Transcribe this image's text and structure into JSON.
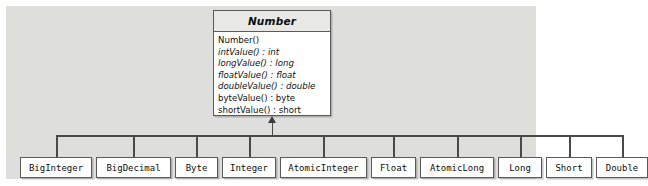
{
  "diagram": {
    "type": "uml-class-diagram",
    "relationship": "generalization",
    "canvas_color": "#dededc",
    "box_fill": "#ffffff",
    "header_fill": "#e8e8e6",
    "line_color": "#4a4a4a",
    "superclass": {
      "name": "Number",
      "abstract": true,
      "members": [
        {
          "text": "Number()",
          "abstract": false
        },
        {
          "text": "intValue() : int",
          "abstract": true
        },
        {
          "text": "longValue() : long",
          "abstract": true
        },
        {
          "text": "floatValue() : float",
          "abstract": true
        },
        {
          "text": "doubleValue() : double",
          "abstract": true
        },
        {
          "text": "byteValue() : byte",
          "abstract": false
        },
        {
          "text": "shortValue() : short",
          "abstract": false
        }
      ]
    },
    "subclasses": [
      {
        "name": "BigInteger",
        "left": 14,
        "width": 72
      },
      {
        "name": "BigDecimal",
        "left": 90,
        "width": 75
      },
      {
        "name": "Byte",
        "left": 169,
        "width": 43
      },
      {
        "name": "Integer",
        "left": 216,
        "width": 54
      },
      {
        "name": "AtomicInteger",
        "left": 274,
        "width": 87
      },
      {
        "name": "Float",
        "left": 365,
        "width": 45
      },
      {
        "name": "AtomicLong",
        "left": 414,
        "width": 74
      },
      {
        "name": "Long",
        "left": 492,
        "width": 44
      },
      {
        "name": "Short",
        "left": 540,
        "width": 46
      },
      {
        "name": "Double",
        "left": 590,
        "width": 52
      }
    ]
  }
}
